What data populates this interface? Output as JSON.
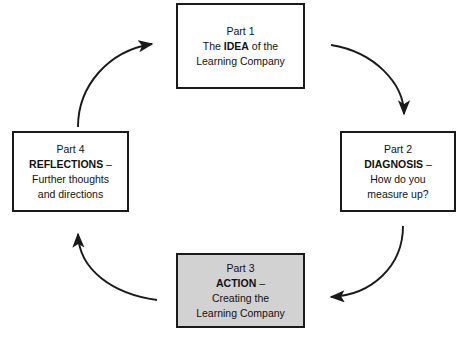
{
  "diagram": {
    "colors": {
      "stroke": "#1a1a1a",
      "shaded_fill": "#d2d2d2",
      "plain_fill": "#ffffff",
      "text": "#111111"
    },
    "boxes": [
      {
        "id": "part1",
        "part_label": "Part 1",
        "line2_prefix": "The ",
        "line2_bold": "IDEA",
        "line2_suffix": " of the",
        "line3": "Learning Company",
        "shaded": false
      },
      {
        "id": "part2",
        "part_label": "Part 2",
        "line2_prefix": "",
        "line2_bold": "DIAGNOSIS",
        "line2_suffix": " –",
        "line3": "How do you",
        "line4": "measure up?",
        "shaded": false
      },
      {
        "id": "part3",
        "part_label": "Part 3",
        "line2_prefix": "",
        "line2_bold": "ACTION",
        "line2_suffix": " –",
        "line3": "Creating the",
        "line4": "Learning Company",
        "shaded": true
      },
      {
        "id": "part4",
        "part_label": "Part 4",
        "line2_prefix": "",
        "line2_bold": "REFLECTIONS",
        "line2_suffix": " –",
        "line3": "Further thoughts",
        "line4": "and directions",
        "shaded": false
      }
    ],
    "arrows": [
      {
        "id": "arrow-part4-to-part1",
        "from": "part4",
        "to": "part1",
        "direction": "clockwise-top-left"
      },
      {
        "id": "arrow-part1-to-part2",
        "from": "part1",
        "to": "part2",
        "direction": "clockwise-top-right"
      },
      {
        "id": "arrow-part2-to-part3",
        "from": "part2",
        "to": "part3",
        "direction": "clockwise-bottom-right"
      },
      {
        "id": "arrow-part3-to-part4",
        "from": "part3",
        "to": "part4",
        "direction": "clockwise-bottom-left"
      }
    ]
  }
}
